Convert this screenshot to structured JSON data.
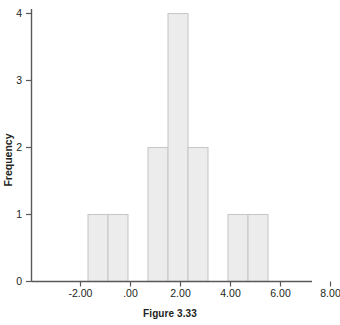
{
  "caption": "Figure 3.33",
  "chart_data": {
    "type": "bar",
    "title": "",
    "subtitle": "",
    "xlabel": "",
    "ylabel": "Frequency",
    "xlim": [
      -3.3,
      8.7
    ],
    "ylim": [
      0,
      4.2
    ],
    "grid": false,
    "legend": null,
    "x_tick_labels": [
      "-2.00",
      ".00",
      "2.00",
      "4.00",
      "6.00",
      "8.00"
    ],
    "x_tick_values": [
      -2,
      0,
      2,
      4,
      6,
      8
    ],
    "y_tick_labels": [
      "0",
      "1",
      "2",
      "3",
      "4"
    ],
    "y_tick_values": [
      0,
      1,
      2,
      3,
      4
    ],
    "bin_width": 0.8,
    "bin_edges": [
      -1.7,
      -0.9,
      -0.1,
      0.7,
      1.5,
      2.3,
      3.1,
      3.9,
      4.7,
      5.5
    ],
    "categories": [
      "-1.7 to -0.9",
      "-0.9 to -0.1",
      "0.7 to 1.5",
      "1.5 to 2.3",
      "2.3 to 3.1",
      "3.9 to 4.7",
      "4.7 to 5.5"
    ],
    "bars": [
      {
        "left": -1.7,
        "right": -0.9,
        "value": 1
      },
      {
        "left": -0.9,
        "right": -0.1,
        "value": 1
      },
      {
        "left": 0.7,
        "right": 1.5,
        "value": 2
      },
      {
        "left": 1.5,
        "right": 2.3,
        "value": 4
      },
      {
        "left": 2.3,
        "right": 3.1,
        "value": 2
      },
      {
        "left": 3.9,
        "right": 4.7,
        "value": 1
      },
      {
        "left": 4.7,
        "right": 5.5,
        "value": 1
      }
    ],
    "values": [
      1,
      1,
      2,
      4,
      2,
      1,
      1
    ],
    "colors": {
      "bar_fill": "#ececec",
      "bar_stroke": "#c9c9c9",
      "axis": "#58595b",
      "text": "#231f20",
      "background": "#ffffff"
    }
  }
}
